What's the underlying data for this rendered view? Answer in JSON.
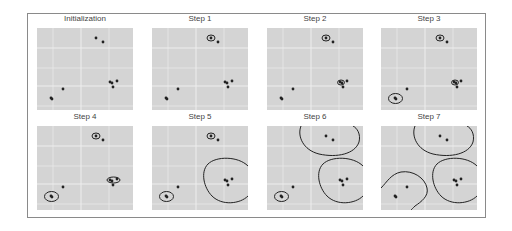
{
  "figure": {
    "panel_background": "#d4d4d4",
    "grid_color": "#eeeeee",
    "point_color": "#222222",
    "ellipse_color": "#222222"
  },
  "points": [
    [
      59,
      10
    ],
    [
      66,
      14
    ],
    [
      73,
      54
    ],
    [
      75,
      55
    ],
    [
      80,
      53
    ],
    [
      76,
      59
    ],
    [
      26,
      61
    ],
    [
      14,
      70
    ],
    [
      15,
      71
    ]
  ],
  "panels": [
    {
      "title": "Initialization",
      "x": 37,
      "y": 28,
      "shapes": []
    },
    {
      "title": "Step 1",
      "x": 152,
      "y": 28,
      "shapes": [
        {
          "type": "ellipse",
          "cx": 59,
          "cy": 10,
          "rx": 4,
          "ry": 3
        }
      ]
    },
    {
      "title": "Step 2",
      "x": 267,
      "y": 28,
      "shapes": [
        {
          "type": "ellipse",
          "cx": 59,
          "cy": 10,
          "rx": 4,
          "ry": 3
        },
        {
          "type": "ellipse",
          "cx": 74,
          "cy": 54.5,
          "rx": 3.5,
          "ry": 2.5
        }
      ]
    },
    {
      "title": "Step 3",
      "x": 381,
      "y": 28,
      "shapes": [
        {
          "type": "ellipse",
          "cx": 59,
          "cy": 10,
          "rx": 4,
          "ry": 3
        },
        {
          "type": "ellipse",
          "cx": 74,
          "cy": 54.5,
          "rx": 3.5,
          "ry": 2.5
        },
        {
          "type": "ellipse",
          "cx": 14.5,
          "cy": 70.5,
          "rx": 7,
          "ry": 5
        }
      ]
    },
    {
      "title": "Step 4",
      "x": 37,
      "y": 126,
      "shapes": [
        {
          "type": "ellipse",
          "cx": 59,
          "cy": 10,
          "rx": 4,
          "ry": 3
        },
        {
          "type": "ellipse",
          "cx": 76.5,
          "cy": 54,
          "rx": 6.5,
          "ry": 3
        },
        {
          "type": "ellipse",
          "cx": 14.5,
          "cy": 70.5,
          "rx": 7,
          "ry": 5
        }
      ]
    },
    {
      "title": "Step 5",
      "x": 152,
      "y": 126,
      "shapes": [
        {
          "type": "ellipse",
          "cx": 59,
          "cy": 10,
          "rx": 4,
          "ry": 3
        },
        {
          "type": "path",
          "d": "M96,40 C86,30 64,30 56,38 C48,46 52,62 60,70 C70,80 88,78 96,70"
        },
        {
          "type": "ellipse",
          "cx": 14.5,
          "cy": 70.5,
          "rx": 7,
          "ry": 5
        }
      ]
    },
    {
      "title": "Step 6",
      "x": 267,
      "y": 126,
      "shapes": [
        {
          "type": "path",
          "d": "M34,0 C30,10 36,24 52,28 C70,32 88,28 92,16 C94,8 90,2 86,0"
        },
        {
          "type": "path",
          "d": "M96,40 C86,30 64,30 56,38 C48,46 52,62 60,70 C70,80 88,78 96,70"
        },
        {
          "type": "ellipse",
          "cx": 14.5,
          "cy": 70.5,
          "rx": 7,
          "ry": 5
        }
      ]
    },
    {
      "title": "Step 7",
      "x": 381,
      "y": 126,
      "shapes": [
        {
          "type": "path",
          "d": "M34,0 C30,10 36,24 52,28 C70,32 88,28 92,16 C94,8 90,2 86,0"
        },
        {
          "type": "path",
          "d": "M96,40 C86,30 64,30 56,38 C48,46 52,62 60,70 C70,80 88,78 96,70"
        },
        {
          "type": "path",
          "d": "M0,62 C6,56 10,48 20,46 C32,44 44,52 46,62 C48,70 40,76 34,80 C32,82 31,83 30,84"
        }
      ]
    }
  ]
}
